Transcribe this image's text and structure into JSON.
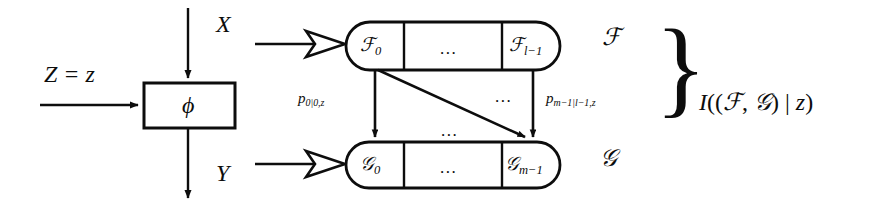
{
  "figure": {
    "stroke_color": "#0d0d0d",
    "background": "#ffffff"
  },
  "inputs": {
    "x_label": "X",
    "y_label": "Y",
    "z_label": "Z = z"
  },
  "channel": {
    "box_label": "ϕ"
  },
  "f_row": {
    "set_label": "ℱ",
    "cells": [
      {
        "label": "ℱ",
        "sub": "0"
      },
      {
        "label": "...",
        "sub": ""
      },
      {
        "label": "ℱ",
        "sub": "l−1"
      }
    ]
  },
  "g_row": {
    "set_label": "𝒢",
    "cells": [
      {
        "label": "𝒢",
        "sub": "0"
      },
      {
        "label": "...",
        "sub": ""
      },
      {
        "label": "𝒢",
        "sub": "m−1"
      }
    ]
  },
  "transitions": {
    "left_prob": {
      "base": "p",
      "sub": "0|0,z"
    },
    "right_prob": {
      "base": "p",
      "sub": "m−1|l−1,z"
    },
    "middle_dots_upper": "...",
    "middle_dots_lower": "..."
  },
  "annotation": {
    "brace": "}",
    "expression": "I((ℱ, 𝒢) | z)",
    "expression_parts": {
      "i": "I",
      "open": "((",
      "f": "ℱ",
      "comma": ", ",
      "g": "𝒢",
      "bar": ") | ",
      "z": "z",
      "close": ")"
    }
  }
}
